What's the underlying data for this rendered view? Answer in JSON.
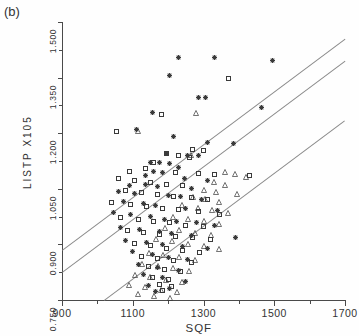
{
  "figure": {
    "panel_label": "(b)",
    "background": "#fefefe",
    "axis_color": "#4a4a4a",
    "line_color": "#8a8a8a",
    "marker_color": "#3a3a3a"
  },
  "chart_data": {
    "type": "scatter",
    "title": "",
    "xlabel": "SQF",
    "ylabel": "LISTP X105",
    "xlim": [
      900,
      1700
    ],
    "ylim": [
      0.75,
      1.5
    ],
    "xticks": [
      900,
      1100,
      1300,
      1500,
      1700
    ],
    "xtick_labels": [
      "900",
      "1100",
      "1300",
      "1500",
      "1700"
    ],
    "yticks": [
      0.75,
      0.9,
      1.05,
      1.2,
      1.35,
      1.5
    ],
    "ytick_labels": [
      "0.750",
      "0.900",
      "1.050",
      "1.200",
      "1.350",
      "1.500"
    ],
    "grid": false,
    "legend": null,
    "minor_xticks": [
      1000,
      1200,
      1400,
      1600
    ],
    "minor_yticks": [
      0.825,
      0.975,
      1.125,
      1.275,
      1.425
    ],
    "lines": [
      {
        "name": "upper-band-line",
        "x": [
          900,
          1700
        ],
        "y": [
          0.885,
          1.455
        ]
      },
      {
        "name": "middle-band-line",
        "x": [
          900,
          1700
        ],
        "y": [
          0.825,
          1.395
        ]
      },
      {
        "name": "lower-band-line",
        "x": [
          1020,
          1700
        ],
        "y": [
          0.75,
          1.235
        ]
      }
    ],
    "series": [
      {
        "name": "star",
        "marker": "asterisk",
        "points": [
          [
            1230,
            1.405
          ],
          [
            1330,
            1.405
          ],
          [
            1495,
            1.395
          ],
          [
            1205,
            1.355
          ],
          [
            1285,
            1.295
          ],
          [
            1305,
            1.295
          ],
          [
            1465,
            1.27
          ],
          [
            1155,
            1.255
          ],
          [
            1110,
            1.21
          ],
          [
            1215,
            1.19
          ],
          [
            1310,
            1.175
          ],
          [
            1385,
            1.172
          ],
          [
            1195,
            1.145
          ],
          [
            1255,
            1.14
          ],
          [
            1285,
            1.14
          ],
          [
            1150,
            1.12
          ],
          [
            1175,
            1.12
          ],
          [
            1205,
            1.118
          ],
          [
            1230,
            1.108
          ],
          [
            1160,
            1.098
          ],
          [
            1185,
            1.095
          ],
          [
            1135,
            1.085
          ],
          [
            1245,
            1.078
          ],
          [
            1310,
            1.073
          ],
          [
            1135,
            1.062
          ],
          [
            1090,
            1.058
          ],
          [
            1170,
            1.055
          ],
          [
            1265,
            1.05
          ],
          [
            1060,
            1.042
          ],
          [
            1105,
            1.038
          ],
          [
            1200,
            1.032
          ],
          [
            1235,
            1.028
          ],
          [
            1295,
            1.022
          ],
          [
            1075,
            1.015
          ],
          [
            1130,
            1.01
          ],
          [
            1165,
            1.005
          ],
          [
            1250,
            0.998
          ],
          [
            1340,
            0.992
          ],
          [
            1045,
            0.985
          ],
          [
            1095,
            0.98
          ],
          [
            1150,
            0.975
          ],
          [
            1190,
            0.968
          ],
          [
            1225,
            0.962
          ],
          [
            1280,
            0.958
          ],
          [
            1330,
            0.952
          ],
          [
            1065,
            0.945
          ],
          [
            1120,
            0.94
          ],
          [
            1175,
            0.935
          ],
          [
            1210,
            0.93
          ],
          [
            1265,
            0.925
          ],
          [
            1390,
            0.918
          ],
          [
            1080,
            0.91
          ],
          [
            1140,
            0.905
          ],
          [
            1185,
            0.9
          ],
          [
            1240,
            0.895
          ],
          [
            1310,
            0.888
          ],
          [
            1100,
            0.88
          ],
          [
            1155,
            0.872
          ],
          [
            1200,
            0.866
          ],
          [
            1255,
            0.858
          ],
          [
            1115,
            0.845
          ],
          [
            1170,
            0.838
          ],
          [
            1230,
            0.83
          ],
          [
            1130,
            0.818
          ],
          [
            1185,
            0.81
          ],
          [
            1250,
            0.8
          ],
          [
            1145,
            0.79
          ],
          [
            1205,
            0.782
          ],
          [
            1165,
            0.772
          ]
        ]
      },
      {
        "name": "square",
        "marker": "open-square",
        "points": [
          [
            1180,
            1.25
          ],
          [
            1370,
            1.348
          ],
          [
            1055,
            1.205
          ],
          [
            1270,
            1.155
          ],
          [
            1300,
            1.152
          ],
          [
            1195,
            1.145
          ],
          [
            1230,
            1.14
          ],
          [
            1260,
            1.135
          ],
          [
            1160,
            1.122
          ],
          [
            1135,
            1.105
          ],
          [
            1090,
            1.098
          ],
          [
            1220,
            1.095
          ],
          [
            1285,
            1.09
          ],
          [
            1330,
            1.088
          ],
          [
            1060,
            1.078
          ],
          [
            1105,
            1.072
          ],
          [
            1150,
            1.068
          ],
          [
            1195,
            1.062
          ],
          [
            1240,
            1.058
          ],
          [
            1080,
            1.045
          ],
          [
            1125,
            1.04
          ],
          [
            1170,
            1.035
          ],
          [
            1215,
            1.03
          ],
          [
            1265,
            1.026
          ],
          [
            1310,
            1.022
          ],
          [
            1040,
            1.012
          ],
          [
            1095,
            1.008
          ],
          [
            1140,
            1.002
          ],
          [
            1185,
            0.998
          ],
          [
            1230,
            0.994
          ],
          [
            1285,
            0.988
          ],
          [
            1345,
            0.982
          ],
          [
            1065,
            0.972
          ],
          [
            1115,
            0.968
          ],
          [
            1160,
            0.962
          ],
          [
            1205,
            0.958
          ],
          [
            1250,
            0.952
          ],
          [
            1300,
            0.948
          ],
          [
            1085,
            0.938
          ],
          [
            1130,
            0.932
          ],
          [
            1175,
            0.928
          ],
          [
            1220,
            0.922
          ],
          [
            1270,
            0.918
          ],
          [
            1320,
            0.912
          ],
          [
            1105,
            0.902
          ],
          [
            1150,
            0.896
          ],
          [
            1195,
            0.89
          ],
          [
            1240,
            0.884
          ],
          [
            1290,
            0.878
          ],
          [
            1125,
            0.868
          ],
          [
            1170,
            0.862
          ],
          [
            1215,
            0.856
          ],
          [
            1265,
            0.85
          ],
          [
            1145,
            0.84
          ],
          [
            1190,
            0.832
          ],
          [
            1235,
            0.826
          ],
          [
            1155,
            0.812
          ],
          [
            1200,
            0.806
          ],
          [
            1175,
            0.792
          ],
          [
            1210,
            0.786
          ],
          [
            1185,
            0.775
          ],
          [
            1430,
            1.085
          ]
        ]
      },
      {
        "name": "triangle",
        "marker": "open-triangle",
        "points": [
          [
            1280,
            1.255
          ],
          [
            1265,
            1.14
          ],
          [
            1115,
            1.205
          ],
          [
            1360,
            1.095
          ],
          [
            1390,
            1.09
          ],
          [
            1420,
            1.082
          ],
          [
            1330,
            1.068
          ],
          [
            1360,
            1.06
          ],
          [
            1300,
            1.048
          ],
          [
            1335,
            1.042
          ],
          [
            1395,
            1.035
          ],
          [
            1270,
            1.028
          ],
          [
            1305,
            1.022
          ],
          [
            1345,
            1.015
          ],
          [
            1240,
            1.005
          ],
          [
            1285,
            0.998
          ],
          [
            1325,
            0.992
          ],
          [
            1370,
            0.985
          ],
          [
            1215,
            0.975
          ],
          [
            1255,
            0.968
          ],
          [
            1300,
            0.962
          ],
          [
            1345,
            0.955
          ],
          [
            1190,
            0.945
          ],
          [
            1230,
            0.938
          ],
          [
            1275,
            0.932
          ],
          [
            1320,
            0.925
          ],
          [
            1165,
            0.915
          ],
          [
            1210,
            0.908
          ],
          [
            1255,
            0.902
          ],
          [
            1300,
            0.895
          ],
          [
            1345,
            0.888
          ],
          [
            1145,
            0.878
          ],
          [
            1185,
            0.872
          ],
          [
            1230,
            0.865
          ],
          [
            1275,
            0.858
          ],
          [
            1125,
            0.848
          ],
          [
            1170,
            0.842
          ],
          [
            1215,
            0.835
          ],
          [
            1260,
            0.828
          ],
          [
            1105,
            0.818
          ],
          [
            1150,
            0.812
          ],
          [
            1195,
            0.805
          ],
          [
            1240,
            0.798
          ],
          [
            1090,
            0.79
          ],
          [
            1135,
            0.784
          ],
          [
            1180,
            0.778
          ],
          [
            1225,
            0.772
          ],
          [
            1115,
            0.765
          ],
          [
            1160,
            0.76
          ],
          [
            1205,
            0.756
          ]
        ]
      }
    ]
  }
}
